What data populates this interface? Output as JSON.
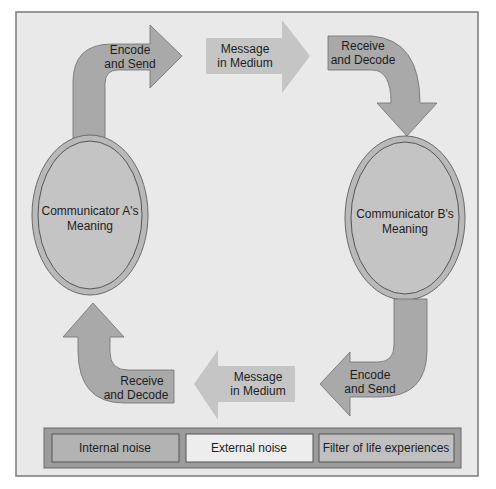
{
  "diagram": {
    "nodes": {
      "communicator_a": {
        "line1": "Communicator A's",
        "line2": "Meaning"
      },
      "communicator_b": {
        "line1": "Communicator B's",
        "line2": "Meaning"
      }
    },
    "arrows": {
      "a_encode_send": {
        "line1": "Encode",
        "line2": "and Send",
        "direction": "right"
      },
      "top_message": {
        "line1": "Message",
        "line2": "in Medium",
        "direction": "right"
      },
      "b_receive_decode": {
        "line1": "Receive",
        "line2": "and Decode",
        "direction": "down"
      },
      "b_encode_send": {
        "line1": "Encode",
        "line2": "and Send",
        "direction": "left"
      },
      "bottom_message": {
        "line1": "Message",
        "line2": "in Medium",
        "direction": "left"
      },
      "a_receive_decode": {
        "line1": "Receive",
        "line2": "and Decode",
        "direction": "up"
      }
    },
    "legend": {
      "items": [
        {
          "label": "Internal noise",
          "shade": "#b3b3b3"
        },
        {
          "label": "External noise",
          "shade": "#ededed"
        },
        {
          "label": "Filter of life experiences",
          "shade": "#c0c0c0"
        }
      ]
    },
    "colors": {
      "background": "#e9e9e9",
      "dark_arrow": "#a9a9a9",
      "light_arrow": "#c5c5c5",
      "ellipse": "#c4c4c4",
      "text": "#1e1e1e"
    }
  }
}
